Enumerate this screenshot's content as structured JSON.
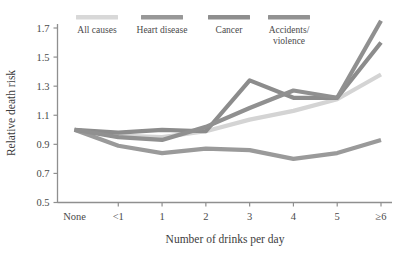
{
  "chart_data": {
    "type": "line",
    "title": "",
    "xlabel": "Number of drinks per day",
    "ylabel": "Relative death risk",
    "categories": [
      "None",
      "<1",
      "1",
      "2",
      "3",
      "4",
      "5",
      "≥6"
    ],
    "xticks": [
      "None",
      "<1",
      "1",
      "2",
      "3",
      "4",
      "5",
      "≥6"
    ],
    "yticks": [
      "0.5",
      "0.7",
      "0.9",
      "1.1",
      "1.3",
      "1.5",
      "1.7"
    ],
    "ylim": [
      0.5,
      1.8
    ],
    "grid": false,
    "legend_position": "top",
    "series": [
      {
        "name": "All causes",
        "color": "#d4d4d4",
        "values": [
          1.0,
          0.96,
          0.95,
          0.99,
          1.07,
          1.13,
          1.21,
          1.38
        ]
      },
      {
        "name": "Heart disease",
        "color": "#9a9a9a",
        "values": [
          1.0,
          0.89,
          0.84,
          0.87,
          0.86,
          0.8,
          0.84,
          0.93
        ]
      },
      {
        "name": "Cancer",
        "color": "#8c8c8c",
        "values": [
          1.0,
          0.98,
          1.0,
          0.99,
          1.34,
          1.22,
          1.22,
          1.6
        ]
      },
      {
        "name": "Accidents/\nviolence",
        "color": "#909090",
        "values": [
          1.0,
          0.95,
          0.93,
          1.02,
          1.15,
          1.27,
          1.22,
          1.75
        ]
      }
    ]
  },
  "legend": {
    "items": [
      {
        "label": "All causes",
        "label2": "",
        "color": "#d8d8d8"
      },
      {
        "label": "Heart disease",
        "label2": "",
        "color": "#989898"
      },
      {
        "label": "Cancer",
        "label2": "",
        "color": "#8e8e8e"
      },
      {
        "label": "Accidents/",
        "label2": "violence",
        "color": "#929292"
      }
    ]
  },
  "axes": {
    "y_title": "Relative death risk",
    "x_title": "Number of drinks per day",
    "y_labels": [
      "1.7",
      "1.5",
      "1.3",
      "1.1",
      "0.9",
      "0.7",
      "0.5"
    ],
    "x_labels": [
      "None",
      "<1",
      "1",
      "2",
      "3",
      "4",
      "5",
      "≥6"
    ]
  },
  "colors": {
    "axis": "#8f8f8f",
    "text": "#4a4a4a",
    "background": "#ffffff"
  }
}
